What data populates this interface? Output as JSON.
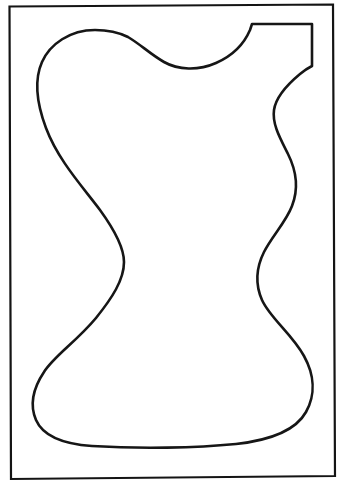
{
  "document": {
    "kind": "line-art-coloring-page",
    "title": "Pitcher outline template",
    "canvas": {
      "width": 342,
      "height": 487
    },
    "background_color": "#ffffff"
  },
  "frame": {
    "name": "page-border",
    "stroke_color": "#141414",
    "stroke_width": 2.2,
    "fill": "none",
    "corners": {
      "top_left": {
        "x": 9,
        "y": 6
      },
      "top_right": {
        "x": 333,
        "y": 4
      },
      "bottom_right": {
        "x": 335,
        "y": 476
      },
      "bottom_left": {
        "x": 11,
        "y": 479
      }
    },
    "path": "M 9.5 6.5 L 333 4.5 L 335 476 L 11 479 Z"
  },
  "artwork": {
    "name": "pitcher-silhouette",
    "description": "Closed freehand outline of a pitcher / jug with a wavy left side, double S-curved right side, a flat rectangular spout notch at the top right, a scalloped rim dip across the top, and a wide rounded base.",
    "stroke_color": "#161616",
    "stroke_width": 2.6,
    "fill_color": "#ffffff",
    "linejoin": "round",
    "linecap": "round",
    "path": "M 95 30 C 70 30 50 44 42 62 C 34 80 37 104 46 128 C 58 160 82 186 100 210 C 116 232 124 248 124 262 C 124 280 112 298 96 318 C 76 342 54 356 44 372 C 32 390 30 406 36 420 C 43 436 62 444 92 446 C 140 449 196 448 236 444 C 272 440 296 430 306 412 C 316 394 314 374 304 356 C 292 334 270 318 262 300 C 255 284 256 268 264 252 C 272 236 286 222 292 206 C 299 188 296 170 288 154 C 280 138 272 124 274 110 C 276 96 288 84 300 74 C 306 69 310 67 312 66 L 312 24 L 252 24 L 250 30 C 244 44 232 56 216 63 C 198 71 178 70 164 62 C 150 54 140 44 128 37 C 118 32 106 30 95 30 Z",
    "key_points": {
      "top_left_hump_peak": {
        "x": 95,
        "y": 30
      },
      "left_outermost": {
        "x": 40,
        "y": 68
      },
      "left_waist_bulge_right": {
        "x": 125,
        "y": 260
      },
      "left_lower_outermost": {
        "x": 33,
        "y": 385
      },
      "base_lowest": {
        "x": 170,
        "y": 446
      },
      "right_lower_outermost": {
        "x": 313,
        "y": 375
      },
      "right_waist_narrowest": {
        "x": 258,
        "y": 292
      },
      "right_upper_bulge": {
        "x": 296,
        "y": 196
      },
      "right_upper_notch": {
        "x": 276,
        "y": 108
      },
      "spout_top_left": {
        "x": 252,
        "y": 24
      },
      "spout_top_right": {
        "x": 312,
        "y": 24
      },
      "spout_bottom_right": {
        "x": 312,
        "y": 66
      },
      "rim_dip_lowest": {
        "x": 196,
        "y": 67
      }
    }
  }
}
